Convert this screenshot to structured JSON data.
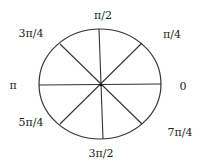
{
  "diagram": {
    "type": "unit-circle-angles",
    "stroke_color": "#333333",
    "background": "#ffffff",
    "circle": {
      "cx": 100,
      "cy": 84,
      "rx": 61,
      "ry": 55
    },
    "spokes": [
      {
        "name": "horizontal-diameter",
        "x1": 39,
        "y1": 85,
        "x2": 161,
        "y2": 84
      },
      {
        "name": "vertical-diameter",
        "x1": 99,
        "y1": 29,
        "x2": 103,
        "y2": 139
      },
      {
        "name": "diagonal-ne-sw",
        "x1": 142,
        "y1": 43,
        "x2": 60,
        "y2": 124
      },
      {
        "name": "diagonal-nw-se",
        "x1": 60,
        "y1": 44,
        "x2": 142,
        "y2": 124
      }
    ],
    "labels": {
      "zero": {
        "text": "0",
        "x": 183,
        "y": 90
      },
      "pi_over_4": {
        "text": "π/4",
        "x": 172,
        "y": 38
      },
      "pi_over_2": {
        "text": "π/2",
        "x": 103,
        "y": 19
      },
      "three_pi_over_4": {
        "text": "3π/4",
        "x": 31,
        "y": 37
      },
      "pi": {
        "text": "π",
        "x": 13,
        "y": 89
      },
      "five_pi_over_4": {
        "text": "5π/4",
        "x": 31,
        "y": 126
      },
      "three_pi_over_2": {
        "text": "3π/2",
        "x": 101,
        "y": 157
      },
      "seven_pi_over_4": {
        "text": "7π/4",
        "x": 180,
        "y": 136
      }
    }
  }
}
